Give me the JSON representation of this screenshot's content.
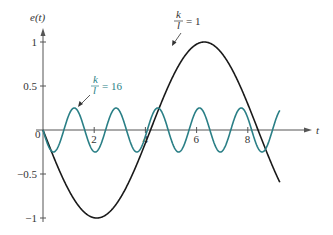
{
  "chart_data": {
    "type": "line",
    "title": "",
    "xlabel": "t",
    "ylabel": "e(t)",
    "xlim": [
      0,
      9.3
    ],
    "ylim": [
      -1,
      1
    ],
    "x_ticks": [
      {
        "v": 2,
        "label": "2"
      },
      {
        "v": 4,
        "label": "4"
      },
      {
        "v": 6,
        "label": "6"
      },
      {
        "v": 8,
        "label": "8"
      }
    ],
    "origin_label": "0",
    "y_ticks": [
      {
        "v": 1,
        "label": "1"
      },
      {
        "v": 0.5,
        "label": "0.5"
      },
      {
        "v": -0.5,
        "label": "-0.5"
      },
      {
        "v": -1,
        "label": "-1"
      }
    ],
    "grid": false,
    "series": [
      {
        "name": "k/l = 1",
        "color": "#1a1a1a",
        "amplitude": -1,
        "period": 8.4,
        "t_end": 9.25
      },
      {
        "name": "k/l = 16",
        "color": "#2a7f86",
        "amplitude": -0.25,
        "period": 1.63,
        "t_end": 9.25
      }
    ],
    "annotations": [
      {
        "text_num": "k",
        "text_den": "l",
        "text_rest": "= 1",
        "series": "k/l = 1"
      },
      {
        "text_num": "k",
        "text_den": "l",
        "text_rest": "= 16",
        "series": "k/l = 16"
      }
    ]
  }
}
